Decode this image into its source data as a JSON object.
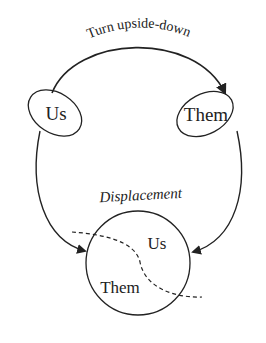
{
  "diagram": {
    "top_arrow_label": "Turn upside-down",
    "left_node": {
      "label": "Us"
    },
    "right_node": {
      "label": "Them"
    },
    "bottom_label": "Displacement",
    "circle": {
      "upper_label": "Us",
      "lower_label": "Them"
    }
  },
  "colors": {
    "ink": "#222222",
    "background": "#ffffff"
  }
}
